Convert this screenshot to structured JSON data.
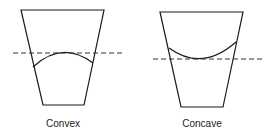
{
  "diagram": {
    "colors": {
      "stroke": "#1a1a1a",
      "dash": "#333333",
      "background": "#ffffff"
    },
    "panels": [
      {
        "id": "convex",
        "label": "Convex",
        "container_points": "21,10 104,10 84,105 43,105",
        "meniscus_path": "M 33 67 Q 62 40 93 63",
        "reference_line": {
          "x1": 13,
          "y1": 53,
          "x2": 125,
          "y2": 53
        }
      },
      {
        "id": "concave",
        "label": "Concave",
        "container_points": "160,12 243,12 223,107 181,107",
        "meniscus_path": "M 169 48 Q 202 72 236 42",
        "reference_line": {
          "x1": 153,
          "y1": 59,
          "x2": 262,
          "y2": 59
        }
      }
    ]
  }
}
